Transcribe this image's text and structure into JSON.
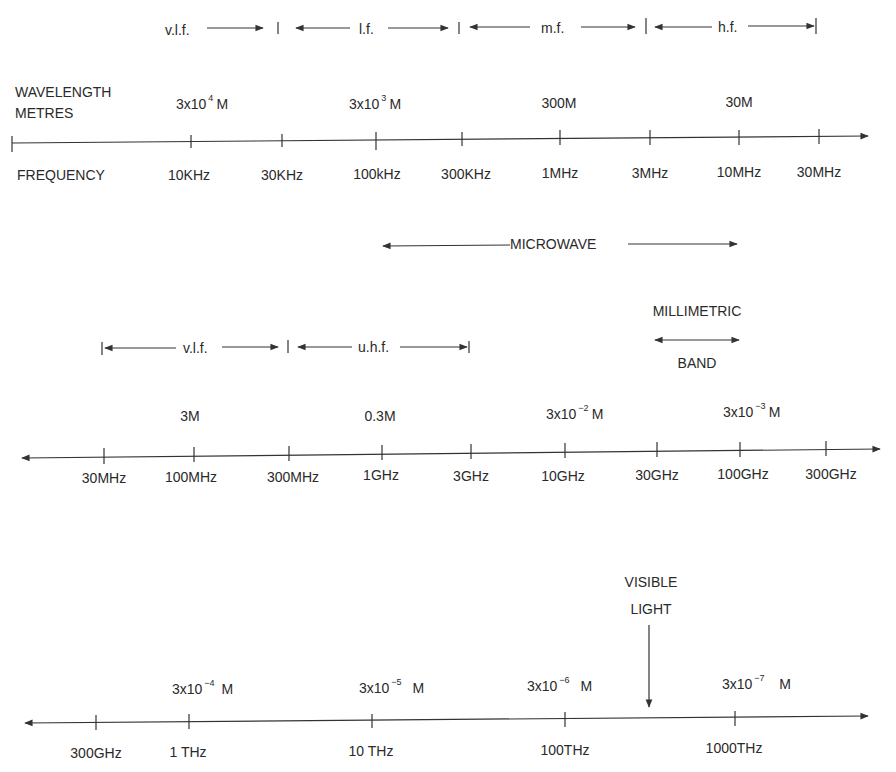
{
  "section1": {
    "bands": [
      {
        "label": "v.l.f."
      },
      {
        "label": "l.f."
      },
      {
        "label": "m.f."
      },
      {
        "label": "h.f."
      }
    ],
    "wavelength_label_line1": "WAVELENGTH",
    "wavelength_label_line2": "METRES",
    "frequency_label": "FREQUENCY",
    "wavelengths": [
      {
        "base": "3x10",
        "exp": "4",
        "unit": "M"
      },
      {
        "base": "3x10",
        "exp": "3",
        "unit": "M"
      },
      {
        "base": "300M",
        "exp": "",
        "unit": ""
      },
      {
        "base": "30M",
        "exp": "",
        "unit": ""
      }
    ],
    "frequencies": [
      "10KHz",
      "30KHz",
      "100kHz",
      "300KHz",
      "1MHz",
      "3MHz",
      "10MHz",
      "30MHz"
    ]
  },
  "section2": {
    "microwave_label": "MICROWAVE",
    "millimetric_line1": "MILLIMETRIC",
    "millimetric_line2": "BAND",
    "bands": [
      {
        "label": "v.l.f."
      },
      {
        "label": "u.h.f."
      }
    ],
    "wavelengths": [
      {
        "base": "3M",
        "exp": "",
        "unit": ""
      },
      {
        "base": "0.3M",
        "exp": "",
        "unit": ""
      },
      {
        "base": "3x10",
        "exp": "−2",
        "unit": "M"
      },
      {
        "base": "3x10",
        "exp": "−3",
        "unit": "M"
      }
    ],
    "frequencies": [
      "30MHz",
      "100MHz",
      "300MHz",
      "1GHz",
      "3GHz",
      "10GHz",
      "30GHz",
      "100GHz",
      "300GHz"
    ]
  },
  "section3": {
    "visible_line1": "VISIBLE",
    "visible_line2": "LIGHT",
    "wavelengths": [
      {
        "base": "3x10",
        "exp": "−4",
        "unit": "M"
      },
      {
        "base": "3x10",
        "exp": "−5",
        "unit": "M"
      },
      {
        "base": "3x10",
        "exp": "−6",
        "unit": "M"
      },
      {
        "base": "3x10",
        "exp": "−7",
        "unit": "M"
      }
    ],
    "frequencies": [
      "300GHz",
      "1 THz",
      "10 THz",
      "100THz",
      "1000THz"
    ]
  }
}
